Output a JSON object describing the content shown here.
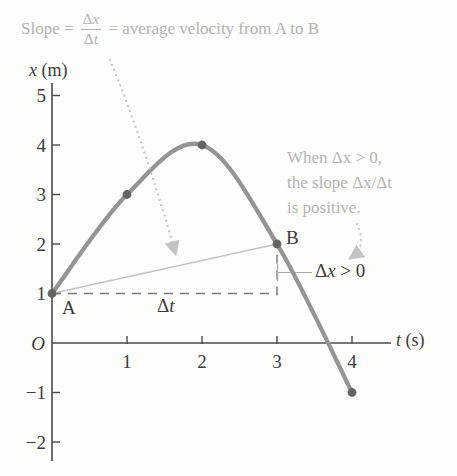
{
  "colors": {
    "bg": "#fdfdfb",
    "axis": "#4a4a4a",
    "dark_text": "#3c3c3c",
    "muted_text": "#b5b5b5",
    "curve": "#949494",
    "point": "#646464",
    "secant": "#c3c3c3",
    "dashed": "#7a7a7a",
    "arrow": "#c3c3c3",
    "bracket": "#a8a8a8"
  },
  "slope_annotation": {
    "prefix": "Slope =",
    "numerator_delta": "Δ",
    "numerator_var": "x",
    "denominator_delta": "Δ",
    "denominator_var": "t",
    "suffix": "= average velocity from A to B"
  },
  "side_note": {
    "line1": "When Δx > 0,",
    "line2": "the slope Δx/Δt",
    "line3": "is positive."
  },
  "chart_data": {
    "type": "line",
    "title": "",
    "xlabel": "t (s)",
    "ylabel": "x (m)",
    "xlabel_var": "t",
    "xlabel_unit": "(s)",
    "ylabel_var": "x",
    "ylabel_unit": "(m)",
    "x": [
      0,
      1,
      2,
      3,
      4
    ],
    "y": [
      1,
      3,
      4,
      2,
      -1
    ],
    "marked_points": [
      [
        0,
        1
      ],
      [
        1,
        3
      ],
      [
        2,
        4
      ],
      [
        3,
        2
      ],
      [
        4,
        -1
      ]
    ],
    "xticks": [
      1,
      2,
      3,
      4
    ],
    "yticks": [
      5,
      4,
      3,
      2,
      1,
      -1,
      -2
    ],
    "origin_label": "O",
    "xlim": [
      0,
      4.5
    ],
    "ylim": [
      -2.4,
      5.3
    ],
    "grid": false,
    "legend": "none",
    "point_A": {
      "label": "A",
      "t": 0,
      "x": 1
    },
    "point_B": {
      "label": "B",
      "t": 3,
      "x": 2
    },
    "secant_from": [
      0,
      1
    ],
    "secant_to": [
      3,
      2
    ],
    "dashed_h": [
      [
        0,
        1
      ],
      [
        3,
        1
      ]
    ],
    "dashed_v": [
      [
        3,
        1
      ],
      [
        3,
        2
      ]
    ],
    "delta_t_label": {
      "delta": "Δ",
      "var": "t"
    },
    "delta_x_label": {
      "delta": "Δ",
      "var": "x",
      "tail": " > 0"
    }
  }
}
